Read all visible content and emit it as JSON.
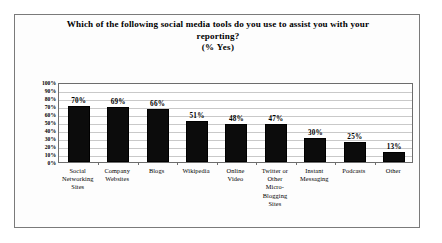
{
  "chart_data": {
    "type": "bar",
    "title": "Which of the following social media tools do you use to assist you with your reporting?",
    "title_lines": [
      "Which of the following social media tools do you use to assist you with your",
      "reporting?"
    ],
    "subtitle": "(% Yes)",
    "xlabel": "",
    "ylabel": "",
    "ylim": [
      0,
      100
    ],
    "ytick_labels": [
      "100%",
      "90%",
      "80%",
      "70%",
      "60%",
      "50%",
      "40%",
      "30%",
      "20%",
      "10%",
      "0%"
    ],
    "ytick_values": [
      100,
      90,
      80,
      70,
      60,
      50,
      40,
      30,
      20,
      10,
      0
    ],
    "grid": true,
    "legend": "none",
    "bar_color": "#0c0c0c",
    "categories": [
      "Social Networking Sites",
      "Company Websites",
      "Blogs",
      "Wikipedia",
      "Online Video",
      "Twitter or Other Micro-Blogging Sites",
      "Instant Messaging",
      "Podcasts",
      "Other"
    ],
    "category_lines": [
      [
        "Social",
        "Networking",
        "Sites"
      ],
      [
        "Company",
        "Websites"
      ],
      [
        "Blogs"
      ],
      [
        "Wikipedia"
      ],
      [
        "Online",
        "Video"
      ],
      [
        "Twitter or",
        "Other",
        "Micro-",
        "Blogging",
        "Sites"
      ],
      [
        "Instant",
        "Messaging"
      ],
      [
        "Podcasts"
      ],
      [
        "Other"
      ]
    ],
    "values": [
      70,
      69,
      66,
      51,
      48,
      47,
      30,
      25,
      13
    ],
    "value_labels": [
      "70%",
      "69%",
      "66%",
      "51%",
      "48%",
      "47%",
      "30%",
      "25%",
      "13%"
    ]
  }
}
